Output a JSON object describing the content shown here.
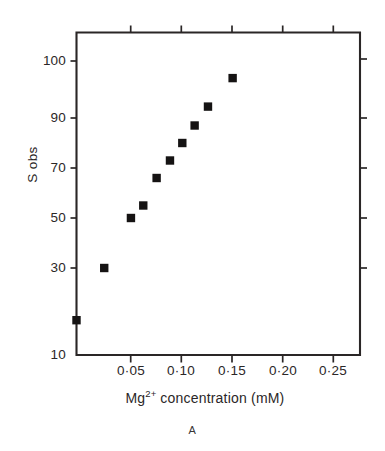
{
  "chart_data": {
    "type": "scatter",
    "title": "",
    "panel_label": "A",
    "xlabel": "Mg2+ concentration (mM)",
    "xlabel_parts": {
      "prefix": "Mg",
      "superscript": "2+",
      "suffix": " concentration (mM)"
    },
    "ylabel": "S obs",
    "xlim": [
      0.0,
      0.2605
    ],
    "ylim": [
      10,
      105
    ],
    "grid": false,
    "legend": null,
    "x_tick_labels": [
      "0·05",
      "0·10",
      "0·15",
      "0·20",
      "0·25"
    ],
    "x_tick_values": [
      0.05,
      0.1,
      0.15,
      0.2,
      0.25
    ],
    "y_tick_labels": [
      "100",
      "90",
      "70",
      "50",
      "30",
      "10"
    ],
    "y_tick_values": [
      100,
      90,
      70,
      50,
      30,
      10
    ],
    "marker": "square",
    "marker_color": "#151313",
    "axis_color": "#2a2626",
    "x": [
      0.0,
      0.027,
      0.053,
      0.065,
      0.078,
      0.091,
      0.103,
      0.115,
      0.128,
      0.152
    ],
    "values": [
      18,
      30,
      50,
      55,
      66,
      73,
      80,
      87,
      92,
      97
    ],
    "points": [
      {
        "x": 0.0,
        "y": 18
      },
      {
        "x": 0.027,
        "y": 30
      },
      {
        "x": 0.053,
        "y": 50
      },
      {
        "x": 0.065,
        "y": 55
      },
      {
        "x": 0.078,
        "y": 66
      },
      {
        "x": 0.091,
        "y": 73
      },
      {
        "x": 0.103,
        "y": 80
      },
      {
        "x": 0.115,
        "y": 87
      },
      {
        "x": 0.128,
        "y": 92
      },
      {
        "x": 0.152,
        "y": 97
      }
    ]
  },
  "axes": {
    "y_labels": {
      "l100": "100",
      "l90": "90",
      "l70": "70",
      "l50": "50",
      "l30": "30",
      "l10": "10"
    },
    "x_labels": {
      "t005": "0·05",
      "t010": "0·10",
      "t015": "0·15",
      "t020": "0·20",
      "t025": "0·25"
    },
    "y_title": "S obs",
    "x_title_prefix": "Mg",
    "x_title_sup": "2+",
    "x_title_suffix": " concentration (mM)"
  },
  "caption": {
    "panel": "A"
  }
}
